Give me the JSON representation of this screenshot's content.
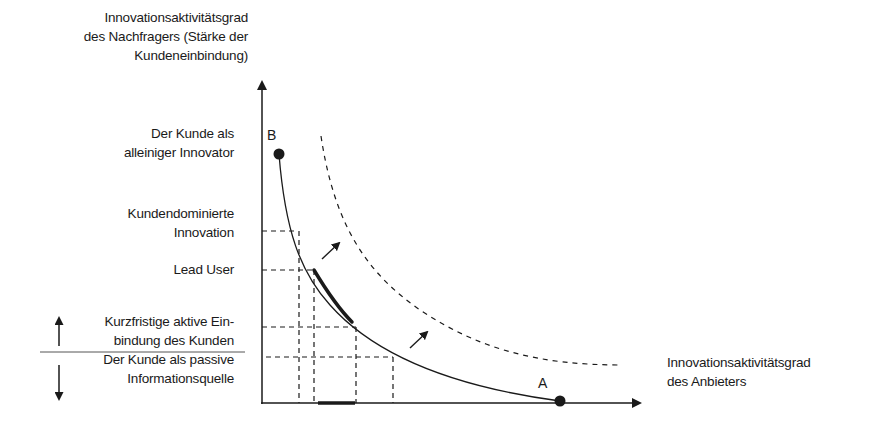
{
  "diagram": {
    "y_axis_title": [
      "Innovationsaktivitätsgrad",
      "des Nachfragers (Stärke der",
      "Kundeneinbindung)"
    ],
    "x_axis_title": [
      "Innovationsaktivitätsgrad",
      "des Anbieters"
    ],
    "y_levels": [
      {
        "label": [
          "Der Kunde als",
          "alleiniger Innovator"
        ]
      },
      {
        "label": [
          "Kundendominierte",
          "Innovation"
        ]
      },
      {
        "label": [
          "Lead User"
        ]
      },
      {
        "label": [
          "Kurzfristige aktive Ein-",
          "bindung des Kunden"
        ]
      },
      {
        "label": [
          "Der Kunde als passive",
          "Informationsquelle"
        ]
      }
    ],
    "points": {
      "B": "B",
      "A": "A"
    },
    "colors": {
      "ink": "#1a1a1a",
      "background": "#ffffff"
    }
  }
}
